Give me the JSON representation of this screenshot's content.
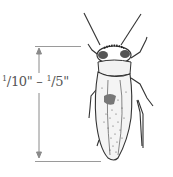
{
  "figure": {
    "size_label": {
      "min_num": "1",
      "min_den": "10\"",
      "separator": " – ",
      "max_num": "1",
      "max_den": "5\""
    },
    "colors": {
      "ink": "#333333",
      "guide": "#9a9a9a",
      "label": "#555555"
    }
  }
}
